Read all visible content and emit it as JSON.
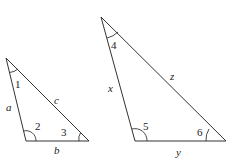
{
  "diagram": {
    "stroke_color": "#333333",
    "triangles": [
      {
        "name": "left",
        "vertices": [
          [
            6,
            58
          ],
          [
            26,
            141
          ],
          [
            89,
            141
          ]
        ],
        "sides": {
          "a": "a",
          "b": "b",
          "c": "c"
        },
        "angles": {
          "apex": "1",
          "bottom_left": "2",
          "bottom_right": "3"
        }
      },
      {
        "name": "right",
        "vertices": [
          [
            101,
            17
          ],
          [
            135,
            141
          ],
          [
            226,
            141
          ]
        ],
        "sides": {
          "x": "x",
          "y": "y",
          "z": "z"
        },
        "angles": {
          "apex": "4",
          "bottom_left": "5",
          "bottom_right": "6"
        }
      }
    ]
  }
}
